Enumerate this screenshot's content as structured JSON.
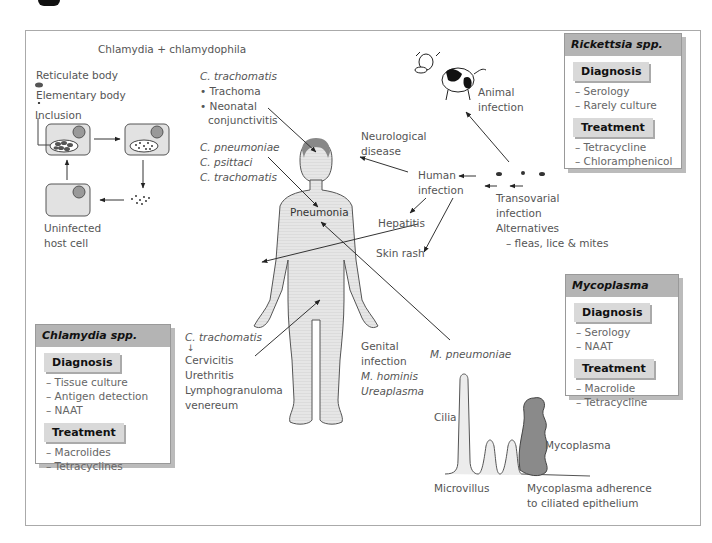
{
  "title": "Chlamydia + chlamydophila",
  "lifecycle": {
    "legend": [
      "Reticulate body",
      "Elementary body"
    ],
    "inclusion_label": "Inclusion",
    "uninfected_label": [
      "Uninfected",
      "host cell"
    ]
  },
  "c_trachomatis_eye": {
    "species": "C. trachomatis",
    "conditions": [
      "Trachoma",
      "Neonatal",
      "conjunctivitis"
    ]
  },
  "pneumonia_species": [
    "C. pneumoniae",
    "C. psittaci",
    "C. trachomatis"
  ],
  "pneumonia_label": "Pneumonia",
  "genital": {
    "species": "C. trachomatis",
    "conditions": [
      "Cervicitis",
      "Urethritis",
      "Lymphogranuloma",
      "venereum"
    ]
  },
  "genital_mycoplasma": {
    "lines": [
      "Genital",
      "infection"
    ],
    "species": [
      "M. hominis",
      "Ureaplasma"
    ]
  },
  "m_pneumoniae_label": "M. pneumoniae",
  "rickettsia_flow": {
    "neurological": [
      "Neurological",
      "disease"
    ],
    "human_infection": [
      "Human",
      "infection"
    ],
    "hepatitis": "Hepatitis",
    "skin_rash": "Skin rash",
    "animal_infection": [
      "Animal",
      "infection"
    ],
    "transovarial": [
      "Transovarial",
      "infection",
      "Alternatives",
      "– fleas, lice & mites"
    ]
  },
  "mycoplasma_adherence": {
    "cilia": "Cilia",
    "microvillus": "Microvillus",
    "mycoplasma": "Mycoplasma",
    "caption": [
      "Mycoplasma adherence",
      "to ciliated epithelium"
    ]
  },
  "boxes": {
    "rickettsia": {
      "title": "Rickettsia spp.",
      "diagnosis_label": "Diagnosis",
      "diagnosis": [
        "– Serology",
        "– Rarely culture"
      ],
      "treatment_label": "Treatment",
      "treatment": [
        "– Tetracycline",
        "– Chloramphenicol"
      ]
    },
    "mycoplasma": {
      "title": "Mycoplasma",
      "diagnosis_label": "Diagnosis",
      "diagnosis": [
        "– Serology",
        "– NAAT"
      ],
      "treatment_label": "Treatment",
      "treatment": [
        "– Macrolide",
        "– Tetracycline"
      ]
    },
    "chlamydia": {
      "title": "Chlamydia spp.",
      "diagnosis_label": "Diagnosis",
      "diagnosis": [
        "– Tissue culture",
        "– Antigen detection",
        "– NAAT"
      ],
      "treatment_label": "Treatment",
      "treatment": [
        "– Macrolides",
        "– Tetracyclines"
      ]
    }
  },
  "colors": {
    "box_header": "#b4b4b4",
    "box_subheader": "#d9d9d9",
    "body_fill": "#e4e4e4",
    "mycoplasma_fill": "#8a8a8a"
  }
}
